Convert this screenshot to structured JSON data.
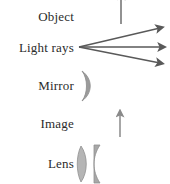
{
  "figure": {
    "background_color": "#ffffff",
    "ink_color": "#4a4a4a",
    "text_color": "#2b2b2b",
    "width": 170,
    "height": 184
  },
  "rows": [
    {
      "label": "Object",
      "symbol": "up-arrow",
      "symbol_description": "vertical arrow pointing up",
      "arrow_color": "#6e6e6e"
    },
    {
      "label": "Light rays",
      "symbol": "diverging-rays",
      "symbol_description": "three straight rays with arrowheads diverging to the right from a common point",
      "ray_count": 3,
      "arrow_color": "#595959"
    },
    {
      "label": "Mirror",
      "symbol": "concave-mirror-arc",
      "symbol_description": "curved crescent arc, concave toward the left",
      "arc_color": "#8c8c8c"
    },
    {
      "label": "Image",
      "symbol": "up-arrow",
      "symbol_description": "vertical arrow pointing up",
      "arrow_color": "#8a8a8a"
    },
    {
      "label": "Lens",
      "symbol": "biconvex-lens",
      "symbol_description": "biconvex lens element beside a thicker plano-convex element",
      "lens_color": "#9a9a9a"
    }
  ]
}
